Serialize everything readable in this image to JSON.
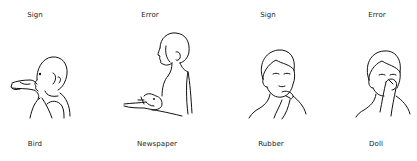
{
  "panels": [
    {
      "top_label": "Sign",
      "bottom_label": "Bird",
      "figure": "profile-person-hand-at-mouth-icon"
    },
    {
      "top_label": "Error",
      "bottom_label": "Newspaper",
      "figure": "profile-person-hand-in-front-of-chest-icon"
    },
    {
      "top_label": "Sign",
      "bottom_label": "Rubber",
      "figure": "front-person-finger-at-chin-icon"
    },
    {
      "top_label": "Error",
      "bottom_label": "Doll",
      "figure": "front-person-finger-at-nose-icon"
    }
  ]
}
